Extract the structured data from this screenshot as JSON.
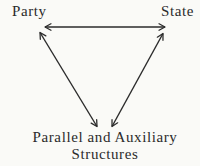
{
  "colors": {
    "ink": "#2b2b2b",
    "background": "#fafaf7"
  },
  "diagram": {
    "nodes": {
      "party": {
        "label": "Party"
      },
      "state": {
        "label": "State"
      },
      "structures": {
        "label": "Parallel and Auxiliary Structures",
        "lines": [
          "Parallel and Auxiliary",
          "Structures"
        ]
      }
    },
    "edges": [
      {
        "id": "party-state",
        "from": "party",
        "to": "state",
        "bidirectional": true,
        "x1": 45,
        "y1": 27,
        "x2": 165,
        "y2": 27
      },
      {
        "id": "party-structures",
        "from": "party",
        "to": "structures",
        "bidirectional": true,
        "x1": 40,
        "y1": 32.5,
        "x2": 97,
        "y2": 126.5
      },
      {
        "id": "state-structures",
        "from": "state",
        "to": "structures",
        "bidirectional": true,
        "x1": 163,
        "y1": 33.5,
        "x2": 112,
        "y2": 126.5
      }
    ]
  }
}
